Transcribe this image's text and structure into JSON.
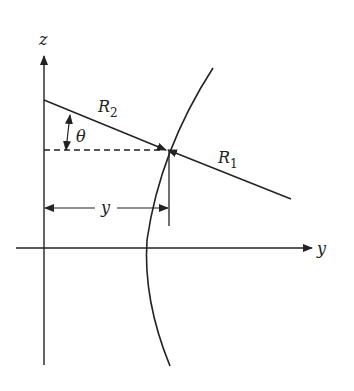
{
  "diagram": {
    "axes": {
      "vertical_label": "z",
      "horizontal_label": "y"
    },
    "labels": {
      "r2_main": "R",
      "r2_sub": "2",
      "r1_main": "R",
      "r1_sub": "1",
      "angle": "θ",
      "distance": "y"
    },
    "colors": {
      "stroke": "#222222",
      "background": "#ffffff"
    }
  }
}
